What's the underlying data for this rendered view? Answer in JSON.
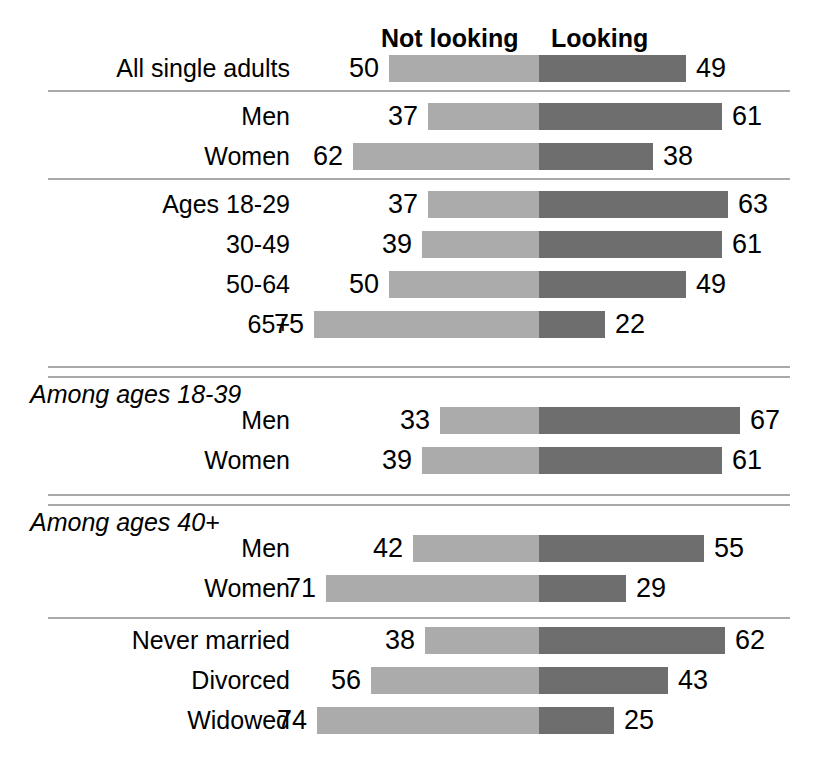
{
  "legend": {
    "left_label": "Not looking",
    "right_label": "Looking",
    "left_color": "#ababab",
    "right_color": "#6e6e6e"
  },
  "group_headers": {
    "among_18_39": "Among ages 18-39",
    "among_40_plus": "Among ages 40+"
  },
  "chart_data": {
    "type": "bar",
    "title": "",
    "subtype": "diverging-stacked-bar",
    "xlabel": "",
    "ylabel": "",
    "legend": [
      "Not looking",
      "Looking"
    ],
    "legend_position": "top",
    "grid": false,
    "axis_center_value": 0,
    "units": "%",
    "categories": [
      "All single adults",
      "Men",
      "Women",
      "Ages 18-29",
      "30-49",
      "50-64",
      "65+",
      "Men",
      "Women",
      "Men",
      "Women",
      "Never married",
      "Divorced",
      "Widowed"
    ],
    "series": [
      {
        "name": "Not looking",
        "values": [
          50,
          37,
          62,
          37,
          39,
          50,
          75,
          33,
          39,
          42,
          71,
          38,
          56,
          74
        ]
      },
      {
        "name": "Looking",
        "values": [
          49,
          61,
          38,
          63,
          61,
          49,
          22,
          67,
          61,
          55,
          29,
          62,
          43,
          25
        ]
      }
    ]
  },
  "rows": [
    {
      "label": "All single adults",
      "not_looking": 50,
      "looking": 49
    },
    {
      "label": "Men",
      "not_looking": 37,
      "looking": 61
    },
    {
      "label": "Women",
      "not_looking": 62,
      "looking": 38
    },
    {
      "label": "Ages 18-29",
      "not_looking": 37,
      "looking": 63
    },
    {
      "label": "30-49",
      "not_looking": 39,
      "looking": 61
    },
    {
      "label": "50-64",
      "not_looking": 50,
      "looking": 49
    },
    {
      "label": "65+",
      "not_looking": 75,
      "looking": 22
    },
    {
      "label": "Men",
      "not_looking": 33,
      "looking": 67
    },
    {
      "label": "Women",
      "not_looking": 39,
      "looking": 61
    },
    {
      "label": "Men",
      "not_looking": 42,
      "looking": 55
    },
    {
      "label": "Women",
      "not_looking": 71,
      "looking": 29
    },
    {
      "label": "Never married",
      "not_looking": 38,
      "looking": 62
    },
    {
      "label": "Divorced",
      "not_looking": 56,
      "looking": 43
    },
    {
      "label": "Widowed",
      "not_looking": 74,
      "looking": 25
    }
  ]
}
